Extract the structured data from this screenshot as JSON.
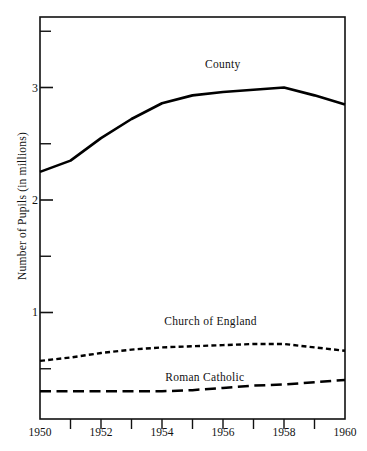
{
  "chart_data": {
    "type": "line",
    "title": "",
    "xlabel": "",
    "ylabel": "Number of Pupils (in millions)",
    "xlim": [
      1950,
      1960
    ],
    "ylim": [
      0.05,
      3.6
    ],
    "grid": false,
    "legend_position": "inline-annotations",
    "x": [
      1950,
      1951,
      1952,
      1953,
      1954,
      1955,
      1956,
      1957,
      1958,
      1959,
      1960
    ],
    "xticks_major": [
      1950,
      1952,
      1954,
      1956,
      1958,
      1960
    ],
    "xticks_minor": [
      1951,
      1953,
      1955,
      1957,
      1959
    ],
    "xtick_labels": [
      "1950",
      "1952",
      "1954",
      "1956",
      "1958",
      "1960"
    ],
    "yticks_major": [
      1,
      2,
      3
    ],
    "yticks_minor": [
      0.5,
      1.5,
      2.5,
      3.5
    ],
    "ytick_labels": [
      "1",
      "2",
      "3"
    ],
    "series": [
      {
        "name": "County",
        "style": "solid",
        "label_x": 1956.0,
        "label_y": 3.2,
        "values": [
          2.25,
          2.35,
          2.55,
          2.72,
          2.86,
          2.93,
          2.96,
          2.98,
          3.0,
          2.93,
          2.85
        ]
      },
      {
        "name": "Church of England",
        "style": "dotted",
        "label_x": 1955.6,
        "label_y": 0.92,
        "values": [
          0.57,
          0.6,
          0.64,
          0.67,
          0.69,
          0.7,
          0.71,
          0.72,
          0.72,
          0.69,
          0.66
        ]
      },
      {
        "name": "Roman Catholic",
        "style": "dashed",
        "label_x": 1955.4,
        "label_y": 0.42,
        "values": [
          0.3,
          0.3,
          0.3,
          0.3,
          0.3,
          0.31,
          0.33,
          0.35,
          0.36,
          0.38,
          0.4
        ]
      }
    ],
    "colors": {
      "axis": "#111111",
      "county": "#000000",
      "church_of_england": "#000000",
      "roman_catholic": "#000000",
      "background": "#ffffff"
    }
  },
  "axis": {
    "ylabel": "Number of Pupils (in millions)"
  },
  "labels": {
    "county": "County",
    "church_of_england": "Church of England",
    "roman_catholic": "Roman Catholic"
  },
  "xticks": {
    "t0": "1950",
    "t1": "1952",
    "t2": "1954",
    "t3": "1956",
    "t4": "1958",
    "t5": "1960"
  },
  "yticks": {
    "t0": "1",
    "t1": "2",
    "t2": "3"
  }
}
